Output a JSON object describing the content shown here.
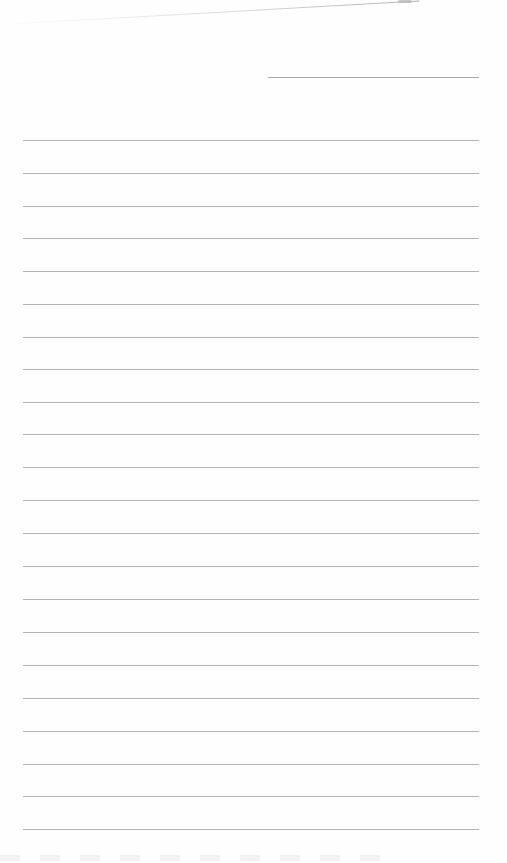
{
  "document": {
    "type": "lined-paper",
    "header_line": {
      "x1": 268,
      "x2": 479,
      "y": 77
    },
    "rules": {
      "x1": 23,
      "x2": 479,
      "y_positions": [
        140,
        173,
        206,
        238,
        271,
        304,
        337,
        369,
        402,
        434,
        467,
        500,
        533,
        566,
        599,
        632,
        665,
        698,
        731,
        764,
        796,
        829
      ]
    },
    "colors": {
      "paper": "#fefefe",
      "rule": "#b4b4b4",
      "header_rule": "#a9a9a9"
    }
  }
}
